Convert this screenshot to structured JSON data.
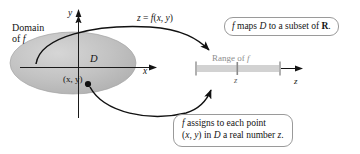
{
  "figure": {
    "name": "function-of-two-variables"
  },
  "domain_region": {
    "caption_line1": "Domain",
    "caption_line2": "of f",
    "set_label": "D",
    "point_label": "(x, y)",
    "fill_color": "#b9b9b9",
    "edge_color": "#9d9d9d"
  },
  "axes": {
    "y_label": "y",
    "x_label": "x",
    "z_label": "z",
    "color": "#1a1a1a"
  },
  "mapping": {
    "function_label": "z = f(x, y)",
    "arrow_color": "#111111"
  },
  "range_line": {
    "label": "Range of f",
    "tick_label": "z",
    "bar_color": "#d2d2d2",
    "cap_color": "#b0b0b0",
    "tick_color": "#8a8a8a",
    "label_color": "#8e8e8e"
  },
  "callouts": {
    "top": {
      "text": "f maps D to a subset of R."
    },
    "bottom": {
      "line1": "f assigns to each point",
      "line2": "(x, y) in D a real number z."
    },
    "border_color": "#9a9a9a"
  }
}
